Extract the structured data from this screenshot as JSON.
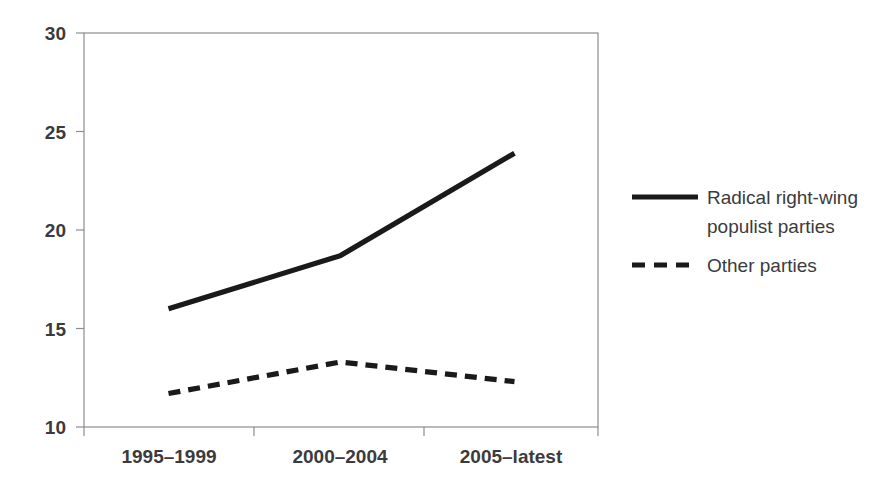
{
  "chart_data": {
    "type": "line",
    "title": "",
    "subtitle": "",
    "xlabel": "",
    "ylabel": "",
    "categories": [
      "1995–1999",
      "2000–2004",
      "2005–latest"
    ],
    "series": [
      {
        "name": "Radical right-wing populist parties",
        "style": "solid",
        "color": "#1a1a1a",
        "values": [
          16.0,
          18.7,
          23.9
        ]
      },
      {
        "name": "Other parties",
        "style": "dashed",
        "color": "#1a1a1a",
        "values": [
          11.7,
          13.3,
          12.3
        ]
      }
    ],
    "ylim": [
      10,
      30
    ],
    "yticks": [
      10,
      15,
      20,
      25,
      30
    ],
    "ytick_labels": [
      "10",
      "15",
      "20",
      "25",
      "30"
    ],
    "grid": false,
    "legend_position": "right"
  },
  "axes": {
    "y_ticks": [
      {
        "label": "30",
        "value": 30
      },
      {
        "label": "25",
        "value": 25
      },
      {
        "label": "20",
        "value": 20
      },
      {
        "label": "15",
        "value": 15
      },
      {
        "label": "10",
        "value": 10
      }
    ],
    "x_ticks": [
      {
        "label": "1995–1999"
      },
      {
        "label": "2000–2004"
      },
      {
        "label": "2005–latest"
      }
    ]
  },
  "legend": {
    "entries": [
      {
        "label_line1": "Radical right-wing",
        "label_line2": "populist parties",
        "style": "solid"
      },
      {
        "label_line1": "Other parties",
        "label_line2": "",
        "style": "dashed"
      }
    ]
  }
}
